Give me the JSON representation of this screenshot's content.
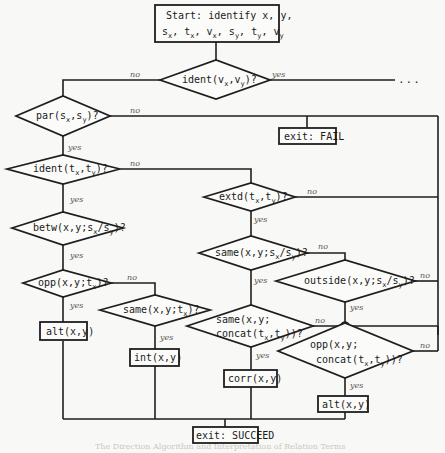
{
  "diagram": {
    "start": {
      "line1": "Start: identify x, y,",
      "line2_parts": [
        {
          "base": "s",
          "sub": "x"
        },
        {
          "sep": ", "
        },
        {
          "base": "t",
          "sub": "x"
        },
        {
          "sep": ", "
        },
        {
          "base": "v",
          "sub": "x"
        },
        {
          "sep": ", "
        },
        {
          "base": "s",
          "sub": "y"
        },
        {
          "sep": ", "
        },
        {
          "base": "t",
          "sub": "y"
        },
        {
          "sep": ", "
        },
        {
          "base": "v",
          "sub": "y"
        }
      ]
    },
    "decisions": {
      "ident_v": "ident(vx,vy)?",
      "par_s": "par(sx,sy)?",
      "ident_t": "ident(tx,ty)?",
      "extd_t": "extd(tx,ty)?",
      "betw": "betw(x,y;sx/sy)?",
      "same_s": "same(x,y;sx/sy)?",
      "outside": "outside(x,y;sx/sy)?",
      "opp_t": "opp(x,y;tx)?",
      "same_t": "same(x,y;tx)?",
      "same_concat": "same(x,y; concat(tx,ty))?",
      "opp_concat": "opp(x,y; concat(tx,ty))?"
    },
    "actions": {
      "exit_fail": "exit: FAIL",
      "alt_left": "alt(x,y)",
      "int": "int(x,y)",
      "corr": "corr(x,y)",
      "alt_right": "alt(x,y)",
      "exit_succeed": "exit: SUCCEED"
    },
    "edge_labels": {
      "yes": "yes",
      "no": "no",
      "continuation": "..."
    },
    "footer_bleedthrough": "The Direction Algorithm and Interpretation of Relation Terms"
  }
}
